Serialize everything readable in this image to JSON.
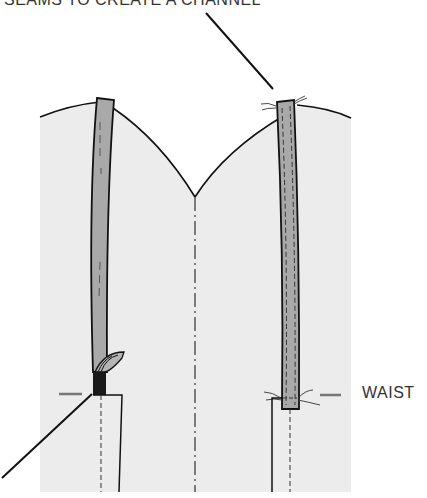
{
  "diagram": {
    "labels": {
      "top": "SEAMS TO CREATE A CHANNEL",
      "waist": "WAIST"
    },
    "colors": {
      "fabric": "#ececec",
      "strap": "#a9a9a9",
      "outline": "#111111",
      "strap_end_dark": "#1a1a1a",
      "label_text": "#333333",
      "waist_marker": "#777777"
    },
    "elements": [
      "bodice-fabric",
      "left-strap-casing",
      "right-strap-casing",
      "center-front-line",
      "waist-markers",
      "leader-lines"
    ]
  }
}
